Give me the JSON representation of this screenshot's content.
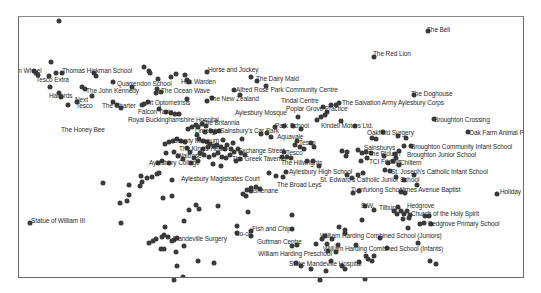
{
  "map": {
    "title": "",
    "point_color": "#3a3a3a",
    "label_color": "#2b2b2b",
    "frame": {
      "left": 18,
      "top": 16,
      "right": 524,
      "bottom": 278
    },
    "labels": [
      {
        "text": "The Bell",
        "x": 426,
        "y": 28
      },
      {
        "text": "The Red Lion",
        "x": 372,
        "y": 52
      },
      {
        "text": "Horse and Jockey",
        "x": 207,
        "y": 68
      },
      {
        "text": "The Dairy Maid",
        "x": 255,
        "y": 77
      },
      {
        "text": "Thomas Hickman School",
        "x": 61,
        "y": 69
      },
      {
        "text": "Swan Wheel",
        "x": 5,
        "y": 69
      },
      {
        "text": "Tesco Extra",
        "x": 35,
        "y": 78
      },
      {
        "text": "Quarrendon School",
        "x": 116,
        "y": 82
      },
      {
        "text": "Hak Warden",
        "x": 180,
        "y": 80
      },
      {
        "text": "The Ocean Wave",
        "x": 160,
        "y": 89
      },
      {
        "text": "Alfred Rose Park Community Centre",
        "x": 235,
        "y": 88
      },
      {
        "text": "The John Kennedy",
        "x": 85,
        "y": 89
      },
      {
        "text": "Halfords",
        "x": 48,
        "y": 94
      },
      {
        "text": "The New Zealand",
        "x": 208,
        "y": 97
      },
      {
        "text": "Tindal Centre",
        "x": 280,
        "y": 99
      },
      {
        "text": "The Doghouse",
        "x": 410,
        "y": 92
      },
      {
        "text": "Next",
        "x": 74,
        "y": 98
      },
      {
        "text": "The Salvation Army Aylesbury Corps",
        "x": 341,
        "y": 101
      },
      {
        "text": "Tesco",
        "x": 75,
        "y": 104
      },
      {
        "text": "The Charter",
        "x": 101,
        "y": 104
      },
      {
        "text": "Fit Optometrists",
        "x": 145,
        "y": 101
      },
      {
        "text": "Poplar Grove Practice",
        "x": 285,
        "y": 107
      },
      {
        "text": "Falcon Taxis",
        "x": 137,
        "y": 110
      },
      {
        "text": "Aylesbury Mosque",
        "x": 234,
        "y": 111
      },
      {
        "text": "Broughton Crossing",
        "x": 433,
        "y": 118
      },
      {
        "text": "Royal Buckinghamshire Hospital",
        "x": 127,
        "y": 118
      },
      {
        "text": "The Britannia",
        "x": 201,
        "y": 121
      },
      {
        "text": "Park School",
        "x": 274,
        "y": 124
      },
      {
        "text": "Kindell Motors Ltd.",
        "x": 320,
        "y": 124
      },
      {
        "text": "The Honey Bee",
        "x": 60,
        "y": 128
      },
      {
        "text": "Limelight",
        "x": 194,
        "y": 129
      },
      {
        "text": "Sainsbury's Car Park",
        "x": 219,
        "y": 129
      },
      {
        "text": "Oak Farm Animal Park",
        "x": 468,
        "y": 131
      },
      {
        "text": "Oakfield Surgery",
        "x": 366,
        "y": 131
      },
      {
        "text": "Aquavale",
        "x": 276,
        "y": 135
      },
      {
        "text": "County Museum",
        "x": 172,
        "y": 139
      },
      {
        "text": "Broughton Community Infant School",
        "x": 410,
        "y": 145
      },
      {
        "text": "Tesco",
        "x": 298,
        "y": 141
      },
      {
        "text": "Sainsburys",
        "x": 363,
        "y": 146
      },
      {
        "text": "The King's Head",
        "x": 178,
        "y": 147
      },
      {
        "text": "Exchange Street",
        "x": 237,
        "y": 149
      },
      {
        "text": "Broughton Junior School",
        "x": 406,
        "y": 153
      },
      {
        "text": "The Plough",
        "x": 367,
        "y": 152
      },
      {
        "text": "Tesco",
        "x": 285,
        "y": 151
      },
      {
        "text": "TCI Fridays",
        "x": 368,
        "y": 160
      },
      {
        "text": "Waitrose",
        "x": 176,
        "y": 154
      },
      {
        "text": "Chiltern",
        "x": 399,
        "y": 161
      },
      {
        "text": "The Greek Taverna",
        "x": 231,
        "y": 157
      },
      {
        "text": "Aylesbury College",
        "x": 148,
        "y": 161
      },
      {
        "text": "The Hillwrights",
        "x": 280,
        "y": 161
      },
      {
        "text": "Aylesbury High School",
        "x": 288,
        "y": 170
      },
      {
        "text": "St. Joseph's Catholic Infant School",
        "x": 390,
        "y": 170
      },
      {
        "text": "Aylesbury Magistrates Court",
        "x": 180,
        "y": 177
      },
      {
        "text": "St. Edward's Catholic Junior School",
        "x": 319,
        "y": 178
      },
      {
        "text": "The Broad Leys",
        "x": 276,
        "y": 183
      },
      {
        "text": "Shenane",
        "x": 252,
        "y": 189
      },
      {
        "text": "Turnfurlong School",
        "x": 350,
        "y": 188
      },
      {
        "text": "Limes Avenue Baptist",
        "x": 399,
        "y": 188
      },
      {
        "text": "Holiday Inn",
        "x": 499,
        "y": 190
      },
      {
        "text": "S.W.",
        "x": 360,
        "y": 204
      },
      {
        "text": "Tilbury",
        "x": 378,
        "y": 206
      },
      {
        "text": "Hedgrove",
        "x": 406,
        "y": 204
      },
      {
        "text": "Church of the Holy Spirit",
        "x": 410,
        "y": 212
      },
      {
        "text": "Statue of William III",
        "x": 30,
        "y": 219
      },
      {
        "text": "Bedgrove Primary School",
        "x": 427,
        "y": 222
      },
      {
        "text": "Fish and Chips",
        "x": 251,
        "y": 227
      },
      {
        "text": "Co-op",
        "x": 234,
        "y": 232
      },
      {
        "text": "Mandeville Surgery",
        "x": 172,
        "y": 237
      },
      {
        "text": "William Harding Combined School (Juniors)",
        "x": 319,
        "y": 234
      },
      {
        "text": "Guttman Centre",
        "x": 256,
        "y": 240
      },
      {
        "text": "William Harding Combined School (Infants)",
        "x": 322,
        "y": 247
      },
      {
        "text": "William Harding Preschool",
        "x": 257,
        "y": 252
      },
      {
        "text": "Stoke Mandeville Hospital",
        "x": 288,
        "y": 262
      }
    ],
    "points": [
      [
        58,
        20
      ],
      [
        427,
        30
      ],
      [
        373,
        56
      ],
      [
        413,
        94
      ],
      [
        50,
        61
      ],
      [
        33,
        70
      ],
      [
        35,
        72
      ],
      [
        37,
        74
      ],
      [
        48,
        75
      ],
      [
        55,
        72
      ],
      [
        61,
        72
      ],
      [
        93,
        72
      ],
      [
        95,
        75
      ],
      [
        112,
        81
      ],
      [
        131,
        86
      ],
      [
        143,
        66
      ],
      [
        148,
        70
      ],
      [
        149,
        72
      ],
      [
        157,
        78
      ],
      [
        170,
        76
      ],
      [
        175,
        73
      ],
      [
        184,
        74
      ],
      [
        186,
        79
      ],
      [
        188,
        81
      ],
      [
        206,
        71
      ],
      [
        250,
        76
      ],
      [
        256,
        80
      ],
      [
        265,
        85
      ],
      [
        233,
        89
      ],
      [
        239,
        94
      ],
      [
        206,
        100
      ],
      [
        211,
        97
      ],
      [
        186,
        98
      ],
      [
        155,
        92
      ],
      [
        160,
        91
      ],
      [
        156,
        88
      ],
      [
        49,
        86
      ],
      [
        58,
        92
      ],
      [
        60,
        96
      ],
      [
        67,
        104
      ],
      [
        76,
        101
      ],
      [
        81,
        86
      ],
      [
        84,
        88
      ],
      [
        91,
        95
      ],
      [
        112,
        101
      ],
      [
        116,
        104
      ],
      [
        120,
        107
      ],
      [
        141,
        104
      ],
      [
        143,
        103
      ],
      [
        147,
        101
      ],
      [
        158,
        108
      ],
      [
        165,
        111
      ],
      [
        170,
        112
      ],
      [
        174,
        113
      ],
      [
        178,
        113
      ],
      [
        187,
        128
      ],
      [
        191,
        126
      ],
      [
        195,
        124
      ],
      [
        197,
        126
      ],
      [
        201,
        123
      ],
      [
        205,
        125
      ],
      [
        204,
        131
      ],
      [
        210,
        130
      ],
      [
        214,
        131
      ],
      [
        218,
        130
      ],
      [
        196,
        134
      ],
      [
        198,
        138
      ],
      [
        202,
        140
      ],
      [
        206,
        141
      ],
      [
        209,
        143
      ],
      [
        213,
        145
      ],
      [
        216,
        144
      ],
      [
        220,
        146
      ],
      [
        224,
        148
      ],
      [
        226,
        144
      ],
      [
        230,
        148
      ],
      [
        232,
        142
      ],
      [
        222,
        139
      ],
      [
        207,
        146
      ],
      [
        202,
        148
      ],
      [
        199,
        152
      ],
      [
        203,
        154
      ],
      [
        208,
        156
      ],
      [
        213,
        154
      ],
      [
        217,
        152
      ],
      [
        221,
        156
      ],
      [
        225,
        157
      ],
      [
        229,
        154
      ],
      [
        233,
        151
      ],
      [
        237,
        148
      ],
      [
        240,
        152
      ],
      [
        244,
        154
      ],
      [
        239,
        158
      ],
      [
        235,
        160
      ],
      [
        184,
        141
      ],
      [
        180,
        140
      ],
      [
        176,
        138
      ],
      [
        172,
        140
      ],
      [
        168,
        141
      ],
      [
        164,
        143
      ],
      [
        186,
        147
      ],
      [
        189,
        151
      ],
      [
        193,
        157
      ],
      [
        197,
        160
      ],
      [
        190,
        162
      ],
      [
        182,
        158
      ],
      [
        177,
        155
      ],
      [
        173,
        151
      ],
      [
        165,
        152
      ],
      [
        161,
        160
      ],
      [
        157,
        162
      ],
      [
        168,
        162
      ],
      [
        212,
        163
      ],
      [
        220,
        165
      ],
      [
        241,
        138
      ],
      [
        260,
        133
      ],
      [
        266,
        132
      ],
      [
        270,
        136
      ],
      [
        274,
        126
      ],
      [
        283,
        125
      ],
      [
        292,
        125
      ],
      [
        300,
        128
      ],
      [
        296,
        140
      ],
      [
        294,
        144
      ],
      [
        299,
        146
      ],
      [
        303,
        148
      ],
      [
        310,
        142
      ],
      [
        313,
        146
      ],
      [
        283,
        151
      ],
      [
        286,
        156
      ],
      [
        290,
        157
      ],
      [
        306,
        160
      ],
      [
        312,
        160
      ],
      [
        318,
        165
      ],
      [
        268,
        172
      ],
      [
        275,
        175
      ],
      [
        282,
        176
      ],
      [
        259,
        188
      ],
      [
        255,
        186
      ],
      [
        250,
        190
      ],
      [
        250,
        187
      ],
      [
        246,
        189
      ],
      [
        242,
        193
      ],
      [
        245,
        195
      ],
      [
        285,
        171
      ],
      [
        281,
        156
      ],
      [
        297,
        116
      ],
      [
        316,
        119
      ],
      [
        320,
        116
      ],
      [
        324,
        114
      ],
      [
        326,
        111
      ],
      [
        322,
        106
      ],
      [
        330,
        104
      ],
      [
        335,
        104
      ],
      [
        338,
        102
      ],
      [
        340,
        120
      ],
      [
        354,
        125
      ],
      [
        371,
        137
      ],
      [
        375,
        138
      ],
      [
        382,
        131
      ],
      [
        397,
        135
      ],
      [
        405,
        137
      ],
      [
        410,
        145
      ],
      [
        403,
        145
      ],
      [
        398,
        150
      ],
      [
        394,
        153
      ],
      [
        395,
        157
      ],
      [
        392,
        160
      ],
      [
        398,
        164
      ],
      [
        387,
        162
      ],
      [
        383,
        155
      ],
      [
        370,
        152
      ],
      [
        365,
        151
      ],
      [
        361,
        152
      ],
      [
        357,
        149
      ],
      [
        346,
        151
      ],
      [
        341,
        150
      ],
      [
        345,
        155
      ],
      [
        360,
        160
      ],
      [
        366,
        157
      ],
      [
        346,
        174
      ],
      [
        351,
        177
      ],
      [
        357,
        174
      ],
      [
        362,
        172
      ],
      [
        384,
        169
      ],
      [
        389,
        170
      ],
      [
        395,
        176
      ],
      [
        403,
        179
      ],
      [
        413,
        174
      ],
      [
        416,
        184
      ],
      [
        433,
        118
      ],
      [
        467,
        131
      ],
      [
        496,
        193
      ],
      [
        352,
        192
      ],
      [
        358,
        190
      ],
      [
        400,
        191
      ],
      [
        404,
        192
      ],
      [
        364,
        205
      ],
      [
        373,
        209
      ],
      [
        397,
        206
      ],
      [
        400,
        210
      ],
      [
        403,
        213
      ],
      [
        406,
        210
      ],
      [
        409,
        214
      ],
      [
        396,
        213
      ],
      [
        393,
        210
      ],
      [
        402,
        218
      ],
      [
        408,
        217
      ],
      [
        424,
        215
      ],
      [
        428,
        215
      ],
      [
        430,
        223
      ],
      [
        419,
        223
      ],
      [
        407,
        227
      ],
      [
        361,
        219
      ],
      [
        29,
        222
      ],
      [
        120,
        222
      ],
      [
        119,
        202
      ],
      [
        128,
        194
      ],
      [
        102,
        182
      ],
      [
        128,
        184
      ],
      [
        126,
        200
      ],
      [
        171,
        179
      ],
      [
        162,
        197
      ],
      [
        140,
        175
      ],
      [
        141,
        181
      ],
      [
        139,
        185
      ],
      [
        146,
        177
      ],
      [
        151,
        176
      ],
      [
        156,
        173
      ],
      [
        158,
        172
      ],
      [
        171,
        195
      ],
      [
        188,
        209
      ],
      [
        183,
        220
      ],
      [
        195,
        204
      ],
      [
        198,
        208
      ],
      [
        217,
        205
      ],
      [
        247,
        211
      ],
      [
        176,
        237
      ],
      [
        173,
        239
      ],
      [
        171,
        240
      ],
      [
        167,
        236
      ],
      [
        161,
        236
      ],
      [
        155,
        238
      ],
      [
        152,
        240
      ],
      [
        148,
        242
      ],
      [
        163,
        234
      ],
      [
        164,
        226
      ],
      [
        160,
        248
      ],
      [
        163,
        248
      ],
      [
        175,
        251
      ],
      [
        183,
        245
      ],
      [
        176,
        265
      ],
      [
        174,
        280
      ],
      [
        236,
        225
      ],
      [
        236,
        232
      ],
      [
        250,
        230
      ],
      [
        250,
        235
      ],
      [
        291,
        214
      ],
      [
        291,
        228
      ],
      [
        291,
        245
      ],
      [
        296,
        244
      ],
      [
        315,
        243
      ],
      [
        321,
        238
      ],
      [
        324,
        235
      ],
      [
        326,
        243
      ],
      [
        331,
        238
      ],
      [
        327,
        250
      ],
      [
        335,
        251
      ],
      [
        337,
        244
      ],
      [
        344,
        229
      ],
      [
        344,
        232
      ],
      [
        338,
        226
      ],
      [
        355,
        244
      ],
      [
        358,
        261
      ],
      [
        365,
        255
      ],
      [
        367,
        258
      ],
      [
        371,
        260
      ],
      [
        373,
        255
      ],
      [
        386,
        247
      ],
      [
        379,
        237
      ],
      [
        417,
        242
      ],
      [
        429,
        260
      ],
      [
        435,
        263
      ],
      [
        423,
        222
      ],
      [
        365,
        279
      ],
      [
        341,
        265
      ],
      [
        344,
        268
      ],
      [
        325,
        270
      ],
      [
        310,
        268
      ],
      [
        330,
        260
      ],
      [
        320,
        280
      ],
      [
        295,
        262
      ],
      [
        300,
        265
      ],
      [
        213,
        262
      ],
      [
        197,
        260
      ],
      [
        182,
        276
      ]
    ]
  }
}
